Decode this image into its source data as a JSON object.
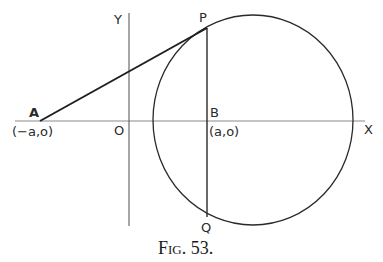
{
  "figure": {
    "caption": "FIG. 53.",
    "caption_prefix": "F",
    "caption_smallcaps": "IG",
    "caption_suffix": ". 53."
  },
  "axes": {
    "x_label": "X",
    "y_label": "Y",
    "origin_label": "O"
  },
  "points": {
    "A": {
      "name": "A",
      "coord_label": "(−a,o)"
    },
    "B": {
      "name": "B",
      "coord_label": "(a,o)"
    },
    "P": {
      "name": "P"
    },
    "Q": {
      "name": "Q"
    }
  },
  "colors": {
    "ink": "#2a2a2a",
    "axis": "#7a7a7a",
    "background": "#ffffff"
  }
}
